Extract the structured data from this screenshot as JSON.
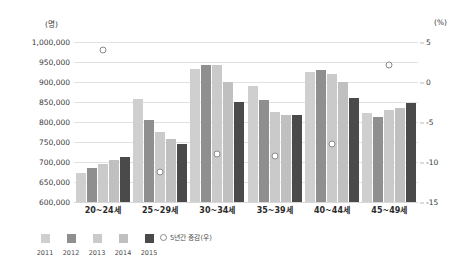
{
  "axes": {
    "left_unit": "(명)",
    "right_unit": "(%)"
  },
  "legend": {
    "marker_label": "5년간 증감(우)",
    "years": [
      "2011",
      "2012",
      "2013",
      "2014",
      "2015"
    ]
  },
  "chart_data": {
    "type": "bar",
    "title": "",
    "subtitle": "",
    "xlabel": "",
    "ylabel": "(명)",
    "y2label": "(%)",
    "grid": true,
    "legend_position": "bottom-left",
    "categories": [
      "20~24세",
      "25~29세",
      "30~34세",
      "35~39세",
      "40~44세",
      "45~49세"
    ],
    "ylim": [
      600000,
      1000000
    ],
    "yticks": [
      "600,000",
      "650,000",
      "700,000",
      "750,000",
      "800,000",
      "850,000",
      "900,000",
      "950,000",
      "1,000,000"
    ],
    "ytick_values": [
      600000,
      650000,
      700000,
      750000,
      800000,
      850000,
      900000,
      950000,
      1000000
    ],
    "y2lim": [
      -15,
      5
    ],
    "y2ticks": [
      "-15",
      "-10",
      "-5",
      "0",
      "5"
    ],
    "y2tick_values": [
      -15,
      -10,
      -5,
      0,
      5
    ],
    "series": [
      {
        "name": "2011",
        "color": "#cfcfcf",
        "values": [
          672000,
          857000,
          932000,
          891000,
          925000,
          822000
        ]
      },
      {
        "name": "2012",
        "color": "#8f8f8f",
        "values": [
          686000,
          806000,
          943000,
          856000,
          929000,
          812000
        ]
      },
      {
        "name": "2013",
        "color": "#cacaca",
        "values": [
          696000,
          776000,
          942000,
          824000,
          920000,
          829000
        ]
      },
      {
        "name": "2014",
        "color": "#c0c0c0",
        "values": [
          704000,
          757000,
          901000,
          818000,
          901000,
          836000
        ]
      },
      {
        "name": "2015",
        "color": "#4a4a4a",
        "values": [
          712000,
          745000,
          851000,
          817000,
          860000,
          848000
        ]
      }
    ],
    "overlay": {
      "name": "5년간 증감(우)",
      "type": "scatter",
      "axis": "right",
      "marker": "open-circle",
      "color": "#8a8a8a",
      "values": [
        4.0,
        -11.2,
        -9.0,
        -9.2,
        -7.8,
        2.1
      ]
    }
  }
}
